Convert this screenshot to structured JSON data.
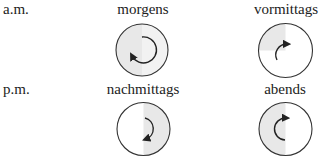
{
  "rows": [
    {
      "label": "a.m.",
      "cells": [
        {
          "label": "morgens",
          "shaded": "full-light-left-half",
          "arrow": "clockwise from 12 to about 8 o'clock"
        },
        {
          "label": "vormittags",
          "shaded": "top-left-quarter",
          "arrow": "clockwise from about 7 to 1 o'clock"
        }
      ]
    },
    {
      "label": "p.m.",
      "cells": [
        {
          "label": "nachmittags",
          "shaded": "right-half",
          "arrow": "clockwise from 12 to 6 o'clock"
        },
        {
          "label": "abends",
          "shaded": "left-half",
          "arrow": "clockwise from 6 to 12 o'clock"
        }
      ]
    }
  ],
  "colors": {
    "stroke": "#333333",
    "shade": "#e6e6e6",
    "shade_light": "#f0f0f0"
  }
}
